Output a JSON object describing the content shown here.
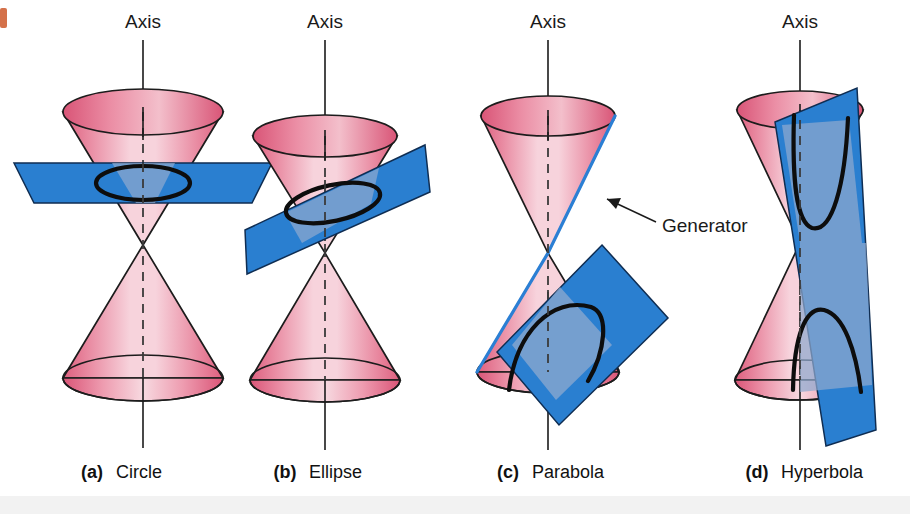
{
  "figure": {
    "title_text_visible": false,
    "background_color": "#ffffff",
    "cone_color_light": "#f6d6de",
    "cone_color_dark": "#e2647f",
    "plane_color": "#2a7fd0",
    "plane_color_translucent": "#7aa8d8",
    "curve_color": "#0d0d0d",
    "generator_highlight_color": "#2b7fd4",
    "corner_mark_color": "#d4714a"
  },
  "panels": [
    {
      "id": "panel-a",
      "letter": "(a)",
      "name": "Circle",
      "axis_label": "Axis",
      "plane_orientation": "horizontal",
      "curve_type": "circle",
      "center_x": 143
    },
    {
      "id": "panel-b",
      "letter": "(b)",
      "name": "Ellipse",
      "axis_label": "Axis",
      "plane_orientation": "tilted",
      "curve_type": "ellipse",
      "center_x": 325
    },
    {
      "id": "panel-c",
      "letter": "(c)",
      "name": "Parabola",
      "axis_label": "Axis",
      "plane_orientation": "parallel-to-generator",
      "curve_type": "parabola",
      "center_x": 548
    },
    {
      "id": "panel-d",
      "letter": "(d)",
      "name": "Hyperbola",
      "axis_label": "Axis",
      "plane_orientation": "near-vertical",
      "curve_type": "hyperbola",
      "center_x": 800
    }
  ],
  "annotations": {
    "generator_label": "Generator"
  }
}
